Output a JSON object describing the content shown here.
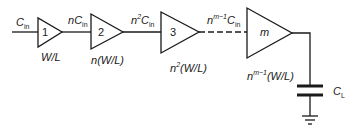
{
  "diagram": {
    "input_label": {
      "prefix": "C",
      "sub": "in"
    },
    "stages": [
      {
        "id": "1",
        "size_label": "W/L",
        "size_prefix": "",
        "size_sup": "",
        "node_label_prefix": "n",
        "node_label_sup": "",
        "node_label_C": "C",
        "node_label_sub": "in"
      },
      {
        "id": "2",
        "size_label": "(W/L)",
        "size_prefix": "n",
        "size_sup": "",
        "node_label_prefix": "n",
        "node_label_sup": "2",
        "node_label_C": "C",
        "node_label_sub": "in"
      },
      {
        "id": "3",
        "size_label": "(W/L)",
        "size_prefix": "n",
        "size_sup": "2",
        "node_label_prefix": "n",
        "node_label_sup": "m−1",
        "node_label_C": "C",
        "node_label_sub": "in"
      },
      {
        "id": "m",
        "size_label": "(W/L)",
        "size_prefix": "n",
        "size_sup": "m−1"
      }
    ],
    "load": {
      "prefix": "C",
      "sub": "L"
    },
    "colors": {
      "stroke": "#1a1a1a",
      "background": "#ffffff"
    }
  }
}
